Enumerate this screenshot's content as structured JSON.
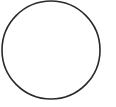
{
  "shape": {
    "type": "circle",
    "cx": 51,
    "cy": 50,
    "r": 49,
    "stroke": "#2a2a2a",
    "stroke_width": 1.6,
    "fill": "none"
  },
  "background": "#ffffff"
}
